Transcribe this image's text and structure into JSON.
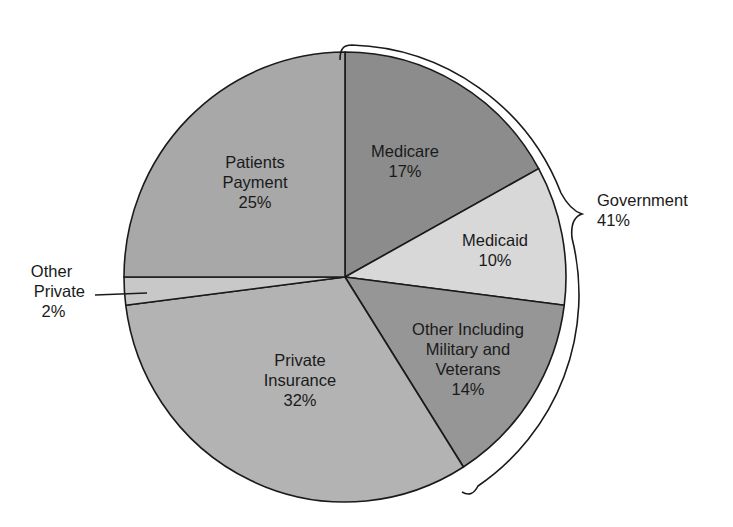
{
  "chart_data": {
    "type": "pie",
    "title": "",
    "start_angle_deg": 0,
    "direction": "clockwise",
    "slices": [
      {
        "label": "Medicare",
        "value": 17,
        "value_label": "17%",
        "color": "#8c8c8c",
        "group": "Government"
      },
      {
        "label": "Medicaid",
        "value": 10,
        "value_label": "10%",
        "color": "#d8d8d8",
        "group": "Government"
      },
      {
        "label": "Other Including Military and Veterans",
        "value": 14,
        "value_label": "14%",
        "color": "#969696",
        "group": "Government"
      },
      {
        "label": "Private Insurance",
        "value": 32,
        "value_label": "32%",
        "color": "#b3b3b3",
        "group": "Private"
      },
      {
        "label": "Other Private",
        "value": 2,
        "value_label": "2%",
        "color": "#c8c8c8",
        "group": "Private"
      },
      {
        "label": "Patients Payment",
        "value": 25,
        "value_label": "25%",
        "color": "#a8a8a8",
        "group": "Private"
      }
    ],
    "annotations": [
      {
        "label": "Government",
        "value_label": "41%",
        "type": "brace",
        "spans": [
          "Medicare",
          "Medicaid",
          "Other Including Military and Veterans"
        ]
      }
    ]
  },
  "labels": {
    "medicare": {
      "line1": "Medicare",
      "line2": "17%"
    },
    "medicaid": {
      "line1": "Medicaid",
      "line2": "10%"
    },
    "other_military": {
      "line1": "Other Including",
      "line2": "Military and",
      "line3": "Veterans",
      "line4": "14%"
    },
    "private_insurance": {
      "line1": "Private",
      "line2": "Insurance",
      "line3": "32%"
    },
    "other_private": {
      "line1": "Other",
      "line2": "Private",
      "line3": "2%"
    },
    "patients_payment": {
      "line1": "Patients",
      "line2": "Payment",
      "line3": "25%"
    },
    "government": {
      "line1": "Government",
      "line2": "41%"
    }
  }
}
